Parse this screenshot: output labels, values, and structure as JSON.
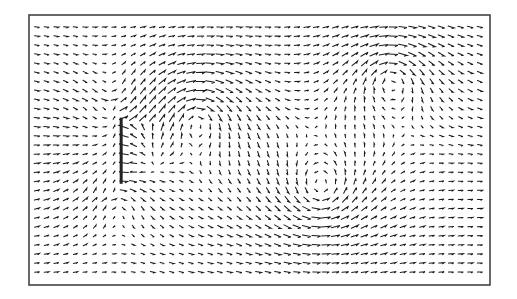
{
  "chart_data": {
    "type": "quiver",
    "title": "",
    "xlabel": "",
    "ylabel": "",
    "grid": {
      "columns": 47,
      "rows": 28,
      "xlim": [
        0,
        1
      ],
      "ylim": [
        0,
        1
      ]
    },
    "freestream": {
      "u": 0.35,
      "v": 0.0
    },
    "obstacle": {
      "type": "flat-plate",
      "orientation": "vertical",
      "x": 0.19,
      "y_range": [
        0.37,
        0.64
      ]
    },
    "vortices": [
      {
        "x": 0.36,
        "y": 0.36,
        "strength": -1.0,
        "core": 0.07
      },
      {
        "x": 0.64,
        "y": 0.68,
        "strength": 1.0,
        "core": 0.08
      },
      {
        "x": 0.8,
        "y": 0.2,
        "strength": -0.9,
        "core": 0.07
      },
      {
        "x": 0.18,
        "y": 0.3,
        "strength": 0.55,
        "core": 0.06
      },
      {
        "x": 0.18,
        "y": 0.7,
        "strength": -0.55,
        "core": 0.06
      }
    ],
    "reverse_flow_zone": {
      "x_range": [
        0.19,
        0.3
      ],
      "y_range": [
        0.4,
        0.62
      ],
      "u": -0.9
    },
    "colors": {
      "arrows": "#1a1a1a",
      "frame": "#444444",
      "plate": "#222222"
    }
  }
}
